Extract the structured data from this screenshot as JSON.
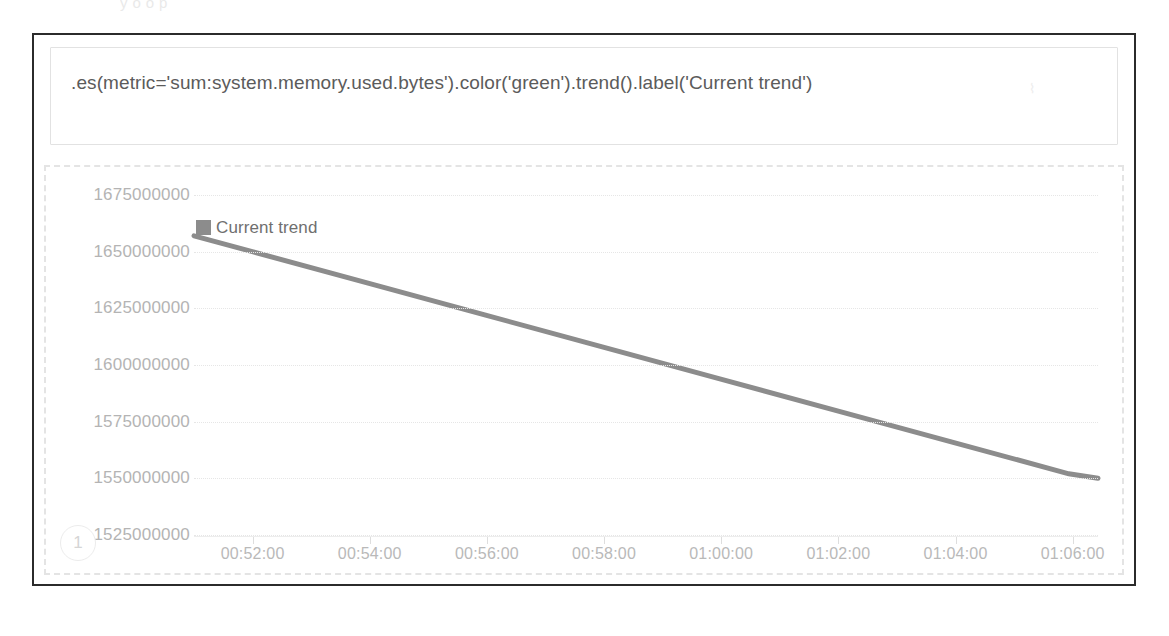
{
  "page_bleed_text": "y     o     o         p",
  "expression": {
    "value": ".es(metric='sum:system.memory.used.bytes').color('green').trend().label('Current trend')",
    "placeholder": "Enter a Timelion expression",
    "caret": "⌇"
  },
  "chart_panel": {
    "series_badge": "1"
  },
  "chart_data": {
    "type": "line",
    "title": "",
    "xlabel": "",
    "ylabel": "",
    "grid": true,
    "legend_position": "top-left",
    "legend": [
      "Current trend"
    ],
    "series": [
      {
        "name": "Current trend",
        "color": "#8c8c8c",
        "x": [
          "00:51:00",
          "00:52:00",
          "00:54:00",
          "00:56:00",
          "00:58:00",
          "01:00:00",
          "01:02:00",
          "01:04:00",
          "01:06:00",
          "01:06:30"
        ],
        "values": [
          1657000000,
          1650000000,
          1636000000,
          1622000000,
          1608000000,
          1594000000,
          1580000000,
          1566000000,
          1552000000,
          1550000000
        ]
      }
    ],
    "x_ticks": [
      "00:52:00",
      "00:54:00",
      "00:56:00",
      "00:58:00",
      "01:00:00",
      "01:02:00",
      "01:04:00",
      "01:06:00"
    ],
    "y_ticks": [
      1675000000,
      1650000000,
      1625000000,
      1600000000,
      1575000000,
      1550000000,
      1525000000
    ],
    "ylim": [
      1525000000,
      1675000000
    ],
    "xlim": [
      "00:51:00",
      "01:06:30"
    ]
  },
  "colors": {
    "frame_border": "#2b2b2b",
    "panel_dashed_border": "#e4e4e4",
    "gridline": "#e6e6e6",
    "axis_text": "#b4b4b4",
    "expression_text": "#5b5b5b",
    "series_line": "#8c8c8c"
  }
}
